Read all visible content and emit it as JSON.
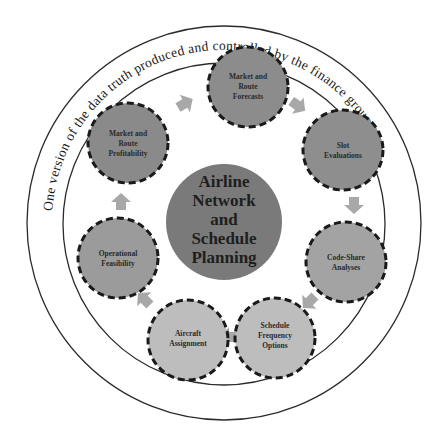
{
  "diagram": {
    "outer_ring_text": "One version of the data truth produced and controlled by the finance group",
    "center": {
      "lines": [
        "Airline",
        "Network",
        "and",
        "Schedule",
        "Planning"
      ],
      "color": "#7a7a7a"
    },
    "nodes": [
      {
        "id": "market-route-forecasts",
        "lines": [
          "Market and",
          "Route",
          "Forecasts"
        ],
        "color": "#8c8c8c"
      },
      {
        "id": "slot-evaluations",
        "lines": [
          "Slot",
          "Evaluations"
        ],
        "color": "#8e8e8e"
      },
      {
        "id": "code-share-analyses",
        "lines": [
          "Code-Share",
          "Analyses"
        ],
        "color": "#a3a3a3"
      },
      {
        "id": "schedule-frequency-options",
        "lines": [
          "Schedule",
          "Frequency",
          "Options"
        ],
        "color": "#bdbdbd"
      },
      {
        "id": "aircraft-assignment",
        "lines": [
          "Aircraft",
          "Assignment"
        ],
        "color": "#bdbdbd"
      },
      {
        "id": "operational-feasibility",
        "lines": [
          "Operational",
          "Feasibility"
        ],
        "color": "#9b9b9b"
      },
      {
        "id": "market-route-profitability",
        "lines": [
          "Market and",
          "Route",
          "Profitability"
        ],
        "color": "#8a8a8a"
      }
    ],
    "arrow_color": "#a8a8a8",
    "ring_stroke": "#2b2b2b",
    "node_border": "#1a1a1a"
  }
}
